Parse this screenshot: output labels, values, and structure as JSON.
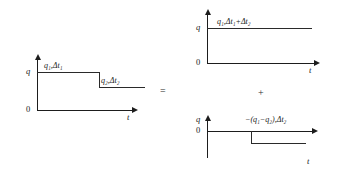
{
  "figure": {
    "type": "diagram",
    "operators": {
      "equals": "=",
      "plus": "+"
    },
    "symbols": {
      "delta": "Δ",
      "minus": "−"
    }
  },
  "charts": [
    {
      "id": "composite",
      "position": "left",
      "axes": {
        "y_label": "q",
        "x_label": "t",
        "baseline_label": "0"
      },
      "annotations": [
        {
          "id": "step1",
          "text": "q₁,Δt₁"
        },
        {
          "id": "step2",
          "text": "q₂,Δt₂"
        }
      ],
      "series": {
        "type": "step",
        "levels": [
          {
            "value": "q1",
            "from": 0.0,
            "to": 0.55
          },
          {
            "value": "q2",
            "from": 0.55,
            "to": 1.0
          }
        ]
      }
    },
    {
      "id": "constant-term",
      "position": "top-right",
      "axes": {
        "y_label": "q",
        "x_label": "t",
        "baseline_label": "0"
      },
      "annotations": [
        {
          "id": "level",
          "text": "q₁,Δt₁+Δt₂"
        }
      ],
      "series": {
        "type": "step",
        "levels": [
          {
            "value": "q1",
            "from": 0.0,
            "to": 1.0
          }
        ]
      }
    },
    {
      "id": "negative-term",
      "position": "bottom-right",
      "axes": {
        "y_label": "q",
        "x_label": "t",
        "baseline_label": "0"
      },
      "annotations": [
        {
          "id": "level",
          "text": "−(q₁−q₂),Δt₂"
        }
      ],
      "series": {
        "type": "step",
        "levels": [
          {
            "value": "0",
            "from": 0.0,
            "to": 0.48
          },
          {
            "value": "-(q1-q2)",
            "from": 0.48,
            "to": 1.0
          }
        ]
      }
    }
  ]
}
